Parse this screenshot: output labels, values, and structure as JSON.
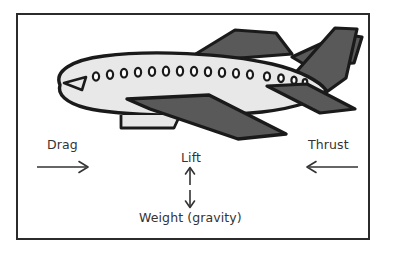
{
  "diagram": {
    "frame": {
      "border_color": "#2b2b2b",
      "background": "#ffffff"
    },
    "forces": [
      {
        "id": "drag",
        "label": "Drag",
        "direction": "right",
        "arrow_icon": "arrow-right-icon"
      },
      {
        "id": "thrust",
        "label": "Thrust",
        "direction": "left",
        "arrow_icon": "arrow-left-icon"
      },
      {
        "id": "lift",
        "label": "Lift",
        "direction": "up",
        "arrow_icon": "arrow-up-icon"
      },
      {
        "id": "weight",
        "label": "Weight (gravity)",
        "direction": "down",
        "arrow_icon": "arrow-down-icon"
      }
    ],
    "colors": {
      "outline": "#1a1a1a",
      "fuselage_fill": "#e8e8e8",
      "wing_fill": "#595959",
      "text": "#333333",
      "frame_border": "#2b2b2b"
    },
    "aircraft": {
      "window_count": 16,
      "parts": [
        "fuselage",
        "cockpit-window",
        "passenger-windows",
        "far-wing",
        "near-wing",
        "vertical-stabilizer",
        "horizontal-stabilizer",
        "under-fuselage-pod"
      ]
    }
  }
}
